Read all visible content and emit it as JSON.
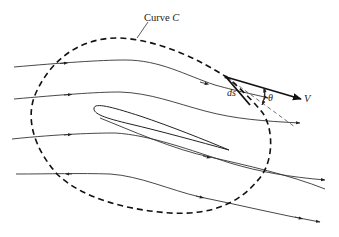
{
  "diagram": {
    "type": "fluid-flow-circulation",
    "labels": {
      "curve": "Curve C",
      "curve_prefix": "Curve ",
      "curve_symbol": "C",
      "element": "ds",
      "angle": "θ",
      "velocity": "V"
    },
    "colors": {
      "background": "#ffffff",
      "stroke": "#222222",
      "dashed_curve": "#111111"
    },
    "elements": {
      "streamlines_count": 5,
      "airfoil": "cambered airfoil shape at center",
      "closed_curve": "dashed contour C enclosing airfoil",
      "velocity_vector": "bold arrow V from point on curve",
      "tangent_line": "dashed tangent to curve at ds"
    }
  }
}
